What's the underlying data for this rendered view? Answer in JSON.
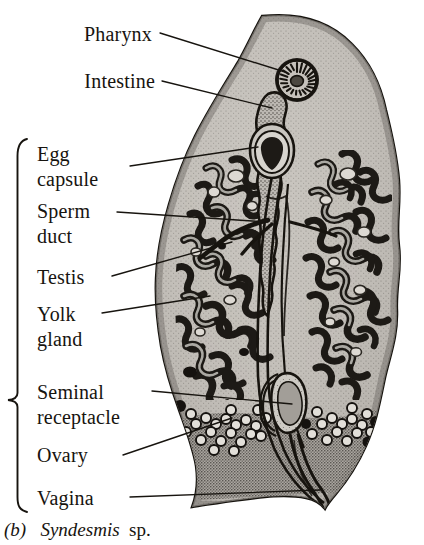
{
  "figure": {
    "caption_index": "(b)",
    "caption_genus": "Syndesmis",
    "caption_suffix": "sp.",
    "organism": "Syndesmis sp.",
    "style": "line drawing, stippled halftone, black ink on white"
  },
  "colors": {
    "ink": "#17140f",
    "body_fill": "#b4b0aa",
    "body_fill_light": "#c9c6c0",
    "parenchyma": "#d2cfc9",
    "organ_dark": "#2a2722",
    "paper": "#ffffff"
  },
  "bracket": {
    "name": "reproductive-system-bracket",
    "top_y": 138,
    "bottom_y": 512,
    "mid_y": 400,
    "x": 17
  },
  "labels": [
    {
      "id": "pharynx",
      "lines": [
        "Pharynx"
      ],
      "align": "right",
      "text_right_x": 152,
      "baseline_y": 40,
      "leader": {
        "from_x": 160,
        "from_y": 33,
        "to_x": 285,
        "to_y": 72
      }
    },
    {
      "id": "intestine",
      "lines": [
        "Intestine"
      ],
      "align": "right",
      "text_right_x": 155,
      "baseline_y": 87,
      "leader": {
        "from_x": 162,
        "from_y": 81,
        "to_x": 272,
        "to_y": 108
      }
    },
    {
      "id": "egg-capsule",
      "lines": [
        "Egg",
        "capsule"
      ],
      "align": "left",
      "text_left_x": 37,
      "baseline_y": 160,
      "leader": {
        "from_x": 130,
        "from_y": 166,
        "to_x": 258,
        "to_y": 147
      }
    },
    {
      "id": "sperm-duct",
      "lines": [
        "Sperm",
        "duct"
      ],
      "align": "left",
      "text_left_x": 37,
      "baseline_y": 217,
      "leader": {
        "from_x": 117,
        "from_y": 212,
        "to_x": 268,
        "to_y": 222
      }
    },
    {
      "id": "testis",
      "lines": [
        "Testis"
      ],
      "align": "left",
      "text_left_x": 37,
      "baseline_y": 283,
      "leader": {
        "from_x": 112,
        "from_y": 276,
        "to_x": 232,
        "to_y": 242
      }
    },
    {
      "id": "yolk-gland",
      "lines": [
        "Yolk",
        "gland"
      ],
      "align": "left",
      "text_left_x": 37,
      "baseline_y": 320,
      "leader": {
        "from_x": 102,
        "from_y": 313,
        "to_x": 210,
        "to_y": 296
      }
    },
    {
      "id": "seminal-receptacle",
      "lines": [
        "Seminal",
        "receptacle"
      ],
      "align": "left",
      "text_left_x": 37,
      "baseline_y": 398,
      "leader": {
        "from_x": 152,
        "from_y": 391,
        "to_x": 292,
        "to_y": 404
      }
    },
    {
      "id": "ovary",
      "lines": [
        "Ovary"
      ],
      "align": "left",
      "text_left_x": 37,
      "baseline_y": 461,
      "leader": {
        "from_x": 123,
        "from_y": 455,
        "to_x": 232,
        "to_y": 418
      }
    },
    {
      "id": "vagina",
      "lines": [
        "Vagina"
      ],
      "align": "left",
      "text_left_x": 37,
      "baseline_y": 504,
      "leader": {
        "from_x": 130,
        "from_y": 497,
        "to_x": 320,
        "to_y": 490
      }
    }
  ],
  "structures": {
    "pharynx": {
      "type": "radial-rosette",
      "cx": 297,
      "cy": 80,
      "r": 21,
      "spokes": 22
    },
    "intestine": {
      "type": "lobed-sac",
      "cx": 272,
      "cy": 115
    },
    "egg_capsule": {
      "type": "teardrop",
      "cx": 272,
      "cy": 150
    },
    "seminal_receptacle": {
      "type": "oval-sac",
      "cx": 292,
      "cy": 402
    },
    "ovary": {
      "type": "follicle-cluster",
      "cy": 420
    },
    "vagina": {
      "type": "duct-opening",
      "cx": 324,
      "cy": 500
    },
    "testis": {
      "type": "branched-lobes"
    },
    "yolk_gland": {
      "type": "branched-lobes"
    },
    "sperm_duct": {
      "type": "paired-ducts"
    }
  }
}
